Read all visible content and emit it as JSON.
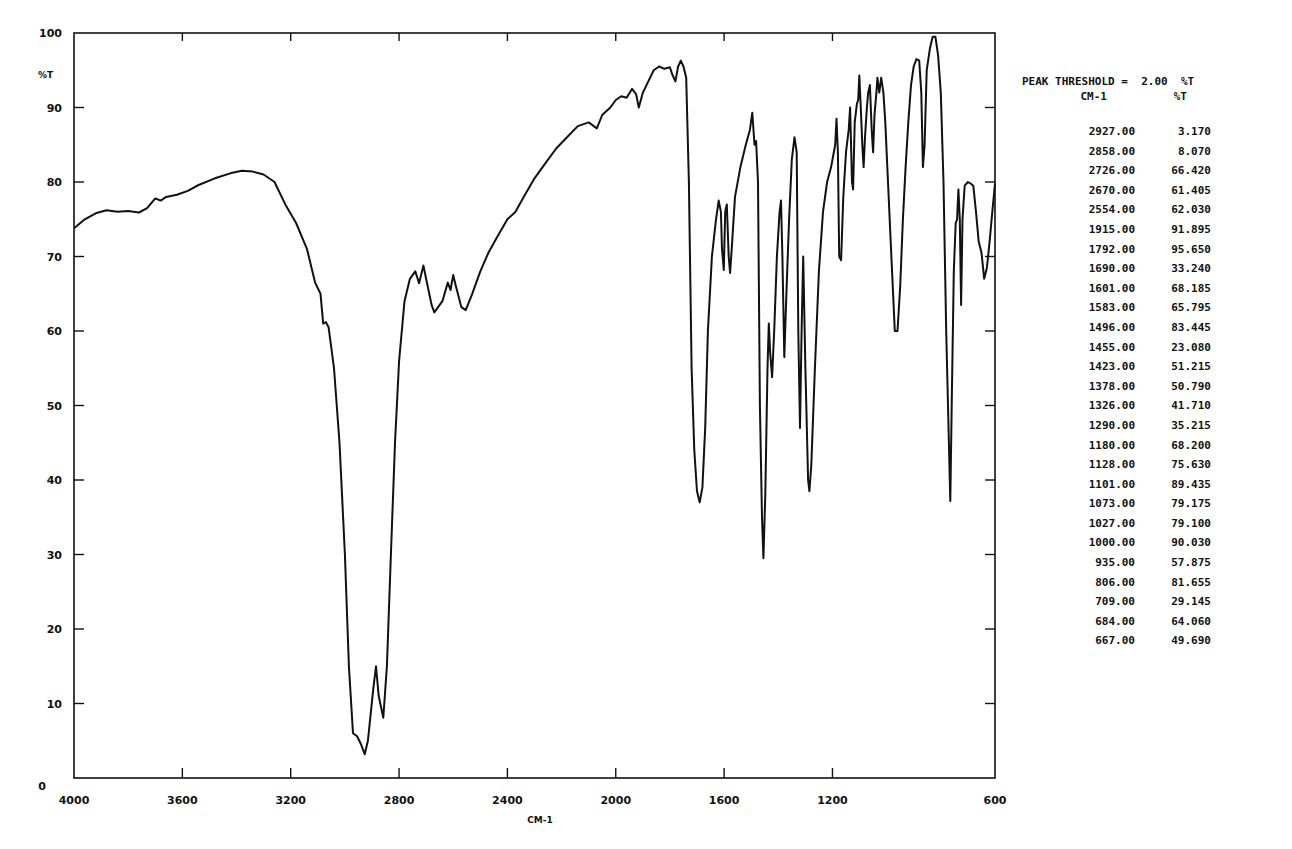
{
  "chart_data": {
    "type": "line",
    "title": "",
    "xlabel": "CM-1",
    "ylabel": "%T",
    "xlim": [
      4000,
      600
    ],
    "ylim": [
      0,
      100
    ],
    "x_reversed": true,
    "grid": false,
    "x_ticks": [
      4000,
      3600,
      3200,
      2800,
      2400,
      2000,
      1600,
      1200,
      600
    ],
    "x_tick_labels": [
      "4000",
      "3600",
      "3200",
      "2800",
      "2400",
      "2000",
      "1600",
      "1200",
      "600"
    ],
    "y_ticks": [
      0,
      10,
      20,
      30,
      40,
      50,
      60,
      70,
      80,
      90,
      100
    ],
    "y_tick_labels": [
      "0",
      "10",
      "20",
      "30",
      "40",
      "50",
      "60",
      "70",
      "80",
      "90",
      "100"
    ],
    "series": [
      {
        "name": "IR spectrum (%T)",
        "points": [
          [
            4000,
            73.8
          ],
          [
            3960,
            75.0
          ],
          [
            3920,
            75.8
          ],
          [
            3880,
            76.2
          ],
          [
            3840,
            76.0
          ],
          [
            3800,
            76.1
          ],
          [
            3760,
            75.9
          ],
          [
            3730,
            76.5
          ],
          [
            3700,
            77.8
          ],
          [
            3680,
            77.5
          ],
          [
            3660,
            78.0
          ],
          [
            3620,
            78.3
          ],
          [
            3580,
            78.8
          ],
          [
            3540,
            79.6
          ],
          [
            3480,
            80.5
          ],
          [
            3420,
            81.2
          ],
          [
            3380,
            81.5
          ],
          [
            3340,
            81.4
          ],
          [
            3300,
            81.0
          ],
          [
            3260,
            80.0
          ],
          [
            3220,
            77.0
          ],
          [
            3180,
            74.5
          ],
          [
            3140,
            71.0
          ],
          [
            3110,
            66.5
          ],
          [
            3090,
            65.0
          ],
          [
            3080,
            61.0
          ],
          [
            3070,
            61.2
          ],
          [
            3060,
            60.5
          ],
          [
            3040,
            55.0
          ],
          [
            3020,
            45.0
          ],
          [
            3000,
            30.0
          ],
          [
            2985,
            15.0
          ],
          [
            2970,
            6.0
          ],
          [
            2955,
            5.6
          ],
          [
            2940,
            4.5
          ],
          [
            2927,
            3.2
          ],
          [
            2915,
            5.0
          ],
          [
            2895,
            12.0
          ],
          [
            2885,
            15.0
          ],
          [
            2875,
            11.0
          ],
          [
            2858,
            8.1
          ],
          [
            2845,
            15.0
          ],
          [
            2830,
            30.0
          ],
          [
            2815,
            45.0
          ],
          [
            2800,
            56.0
          ],
          [
            2780,
            64.0
          ],
          [
            2760,
            67.0
          ],
          [
            2740,
            68.0
          ],
          [
            2726,
            66.4
          ],
          [
            2710,
            68.8
          ],
          [
            2700,
            67.0
          ],
          [
            2680,
            63.5
          ],
          [
            2670,
            62.5
          ],
          [
            2640,
            64.0
          ],
          [
            2620,
            66.5
          ],
          [
            2610,
            65.5
          ],
          [
            2600,
            67.5
          ],
          [
            2590,
            66.0
          ],
          [
            2570,
            63.2
          ],
          [
            2554,
            62.8
          ],
          [
            2530,
            65.0
          ],
          [
            2500,
            68.0
          ],
          [
            2470,
            70.5
          ],
          [
            2440,
            72.5
          ],
          [
            2400,
            75.0
          ],
          [
            2370,
            76.0
          ],
          [
            2340,
            78.0
          ],
          [
            2300,
            80.5
          ],
          [
            2260,
            82.5
          ],
          [
            2220,
            84.5
          ],
          [
            2180,
            86.0
          ],
          [
            2140,
            87.5
          ],
          [
            2100,
            88.0
          ],
          [
            2070,
            87.2
          ],
          [
            2050,
            89.0
          ],
          [
            2020,
            90.0
          ],
          [
            2000,
            91.0
          ],
          [
            1980,
            91.5
          ],
          [
            1960,
            91.3
          ],
          [
            1940,
            92.5
          ],
          [
            1925,
            91.8
          ],
          [
            1915,
            90.0
          ],
          [
            1900,
            92.0
          ],
          [
            1880,
            93.5
          ],
          [
            1860,
            95.0
          ],
          [
            1840,
            95.5
          ],
          [
            1820,
            95.2
          ],
          [
            1800,
            95.4
          ],
          [
            1792,
            94.5
          ],
          [
            1780,
            93.5
          ],
          [
            1770,
            95.5
          ],
          [
            1760,
            96.3
          ],
          [
            1750,
            95.5
          ],
          [
            1740,
            94.0
          ],
          [
            1730,
            80.0
          ],
          [
            1720,
            55.0
          ],
          [
            1710,
            44.0
          ],
          [
            1700,
            38.5
          ],
          [
            1690,
            37.0
          ],
          [
            1680,
            39.0
          ],
          [
            1670,
            47.0
          ],
          [
            1660,
            60.0
          ],
          [
            1645,
            70.0
          ],
          [
            1630,
            75.0
          ],
          [
            1620,
            77.5
          ],
          [
            1612,
            76.0
          ],
          [
            1608,
            71.0
          ],
          [
            1601,
            68.2
          ],
          [
            1596,
            76.0
          ],
          [
            1590,
            77.0
          ],
          [
            1583,
            70.0
          ],
          [
            1578,
            67.8
          ],
          [
            1570,
            72.0
          ],
          [
            1560,
            78.0
          ],
          [
            1540,
            82.0
          ],
          [
            1520,
            85.0
          ],
          [
            1505,
            87.0
          ],
          [
            1496,
            89.3
          ],
          [
            1488,
            85.0
          ],
          [
            1482,
            85.5
          ],
          [
            1475,
            80.0
          ],
          [
            1468,
            50.0
          ],
          [
            1460,
            35.0
          ],
          [
            1455,
            29.5
          ],
          [
            1448,
            38.0
          ],
          [
            1440,
            55.0
          ],
          [
            1435,
            61.0
          ],
          [
            1430,
            57.0
          ],
          [
            1423,
            53.8
          ],
          [
            1415,
            60.0
          ],
          [
            1405,
            70.0
          ],
          [
            1395,
            76.0
          ],
          [
            1390,
            77.5
          ],
          [
            1385,
            70.0
          ],
          [
            1378,
            56.5
          ],
          [
            1370,
            65.0
          ],
          [
            1360,
            75.0
          ],
          [
            1350,
            83.0
          ],
          [
            1340,
            86.0
          ],
          [
            1332,
            84.0
          ],
          [
            1326,
            60.0
          ],
          [
            1320,
            47.0
          ],
          [
            1314,
            60.0
          ],
          [
            1308,
            70.0
          ],
          [
            1300,
            55.0
          ],
          [
            1290,
            40.0
          ],
          [
            1285,
            38.5
          ],
          [
            1278,
            42.0
          ],
          [
            1265,
            55.0
          ],
          [
            1250,
            68.0
          ],
          [
            1235,
            76.0
          ],
          [
            1220,
            80.0
          ],
          [
            1205,
            82.0
          ],
          [
            1190,
            85.0
          ],
          [
            1185,
            88.5
          ],
          [
            1180,
            84.0
          ],
          [
            1175,
            70.0
          ],
          [
            1168,
            69.5
          ],
          [
            1160,
            78.0
          ],
          [
            1150,
            84.0
          ],
          [
            1140,
            87.0
          ],
          [
            1135,
            90.0
          ],
          [
            1128,
            80.0
          ],
          [
            1124,
            79.0
          ],
          [
            1118,
            88.0
          ],
          [
            1110,
            90.5
          ],
          [
            1105,
            91.0
          ],
          [
            1101,
            94.3
          ],
          [
            1096,
            90.5
          ],
          [
            1090,
            85.0
          ],
          [
            1085,
            82.0
          ],
          [
            1080,
            86.0
          ],
          [
            1073,
            90.0
          ],
          [
            1068,
            92.0
          ],
          [
            1062,
            93.0
          ],
          [
            1055,
            87.0
          ],
          [
            1050,
            84.0
          ],
          [
            1045,
            89.0
          ],
          [
            1038,
            92.0
          ],
          [
            1034,
            94.0
          ],
          [
            1027,
            92.0
          ],
          [
            1020,
            94.0
          ],
          [
            1012,
            92.0
          ],
          [
            1005,
            88.0
          ],
          [
            995,
            80.0
          ],
          [
            985,
            72.0
          ],
          [
            970,
            60.0
          ],
          [
            960,
            60.0
          ],
          [
            950,
            66.0
          ],
          [
            940,
            75.0
          ],
          [
            930,
            82.0
          ],
          [
            920,
            88.0
          ],
          [
            910,
            93.0
          ],
          [
            900,
            95.5
          ],
          [
            890,
            96.5
          ],
          [
            880,
            96.3
          ],
          [
            872,
            92.0
          ],
          [
            866,
            82.0
          ],
          [
            860,
            85.0
          ],
          [
            852,
            95.0
          ],
          [
            840,
            98.0
          ],
          [
            830,
            99.5
          ],
          [
            820,
            99.5
          ],
          [
            810,
            97.0
          ],
          [
            800,
            92.0
          ],
          [
            790,
            80.0
          ],
          [
            780,
            60.0
          ],
          [
            770,
            45.0
          ],
          [
            765,
            37.2
          ],
          [
            760,
            50.0
          ],
          [
            752,
            68.0
          ],
          [
            745,
            74.5
          ],
          [
            740,
            75.0
          ],
          [
            735,
            79.0
          ],
          [
            730,
            75.0
          ],
          [
            725,
            63.5
          ],
          [
            720,
            75.0
          ],
          [
            712,
            79.5
          ],
          [
            700,
            80.0
          ],
          [
            690,
            79.8
          ],
          [
            680,
            79.5
          ],
          [
            670,
            76.0
          ],
          [
            660,
            72.0
          ],
          [
            650,
            70.5
          ],
          [
            640,
            67.0
          ],
          [
            630,
            68.5
          ],
          [
            620,
            72.0
          ],
          [
            610,
            76.0
          ],
          [
            600,
            79.8
          ]
        ]
      }
    ],
    "annotations": {
      "peak_threshold": "PEAK THRESHOLD =  2.00  %T",
      "peak_table_columns": [
        "CM-1",
        "%T"
      ],
      "peaks": [
        {
          "cm": "2927.00",
          "t": "3.170"
        },
        {
          "cm": "2858.00",
          "t": "8.070"
        },
        {
          "cm": "2726.00",
          "t": "66.420"
        },
        {
          "cm": "2670.00",
          "t": "61.405"
        },
        {
          "cm": "2554.00",
          "t": "62.030"
        },
        {
          "cm": "1915.00",
          "t": "91.895"
        },
        {
          "cm": "1792.00",
          "t": "95.650"
        },
        {
          "cm": "1690.00",
          "t": "33.240"
        },
        {
          "cm": "1601.00",
          "t": "68.185"
        },
        {
          "cm": "1583.00",
          "t": "65.795"
        },
        {
          "cm": "1496.00",
          "t": "83.445"
        },
        {
          "cm": "1455.00",
          "t": "23.080"
        },
        {
          "cm": "1423.00",
          "t": "51.215"
        },
        {
          "cm": "1378.00",
          "t": "50.790"
        },
        {
          "cm": "1326.00",
          "t": "41.710"
        },
        {
          "cm": "1290.00",
          "t": "35.215"
        },
        {
          "cm": "1180.00",
          "t": "68.200"
        },
        {
          "cm": "1128.00",
          "t": "75.630"
        },
        {
          "cm": "1101.00",
          "t": "89.435"
        },
        {
          "cm": "1073.00",
          "t": "79.175"
        },
        {
          "cm": "1027.00",
          "t": "79.100"
        },
        {
          "cm": "1000.00",
          "t": "90.030"
        },
        {
          "cm": "935.00",
          "t": "57.875"
        },
        {
          "cm": "806.00",
          "t": "81.655"
        },
        {
          "cm": "709.00",
          "t": "29.145"
        },
        {
          "cm": "684.00",
          "t": "64.060"
        },
        {
          "cm": "667.00",
          "t": "49.690"
        }
      ]
    }
  },
  "axes": {
    "x_title": "CM-1",
    "y_title": "%T"
  },
  "peak_panel": {
    "threshold_label": "PEAK THRESHOLD =  2.00  %T",
    "col_cm": "CM-1",
    "col_t": "%T"
  },
  "colors": {
    "line": "#111111",
    "axis": "#111111",
    "background": "#ffffff"
  }
}
